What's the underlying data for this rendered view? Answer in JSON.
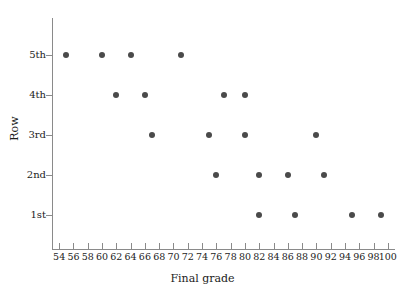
{
  "chart_data": {
    "type": "scatter",
    "title": "",
    "xlabel": "Final grade",
    "ylabel": "Row",
    "xlim": [
      53,
      101
    ],
    "xticks": [
      54,
      56,
      58,
      60,
      62,
      64,
      66,
      68,
      70,
      72,
      74,
      76,
      78,
      80,
      82,
      84,
      86,
      88,
      90,
      92,
      94,
      96,
      98,
      100
    ],
    "xtick_labels": [
      "54",
      "56",
      "58",
      "60",
      "62",
      "64",
      "66",
      "68",
      "70",
      "72",
      "74",
      "76",
      "78",
      "80",
      "82",
      "84",
      "86",
      "88",
      "90",
      "92",
      "94",
      "96",
      "98",
      "100"
    ],
    "ycategories": [
      "1st",
      "2nd",
      "3rd",
      "4th",
      "5th"
    ],
    "ytick_labels": [
      "5th",
      "4th",
      "3rd",
      "2nd",
      "1st"
    ],
    "grid": false,
    "legend": false,
    "marker_color": "#4a4a4a",
    "axis_color": "#8a8a8a",
    "points": [
      {
        "x": 55,
        "y": "5th"
      },
      {
        "x": 60,
        "y": "5th"
      },
      {
        "x": 64,
        "y": "5th"
      },
      {
        "x": 71,
        "y": "5th"
      },
      {
        "x": 62,
        "y": "4th"
      },
      {
        "x": 66,
        "y": "4th"
      },
      {
        "x": 77,
        "y": "4th"
      },
      {
        "x": 80,
        "y": "4th"
      },
      {
        "x": 67,
        "y": "3rd"
      },
      {
        "x": 75,
        "y": "3rd"
      },
      {
        "x": 80,
        "y": "3rd"
      },
      {
        "x": 90,
        "y": "3rd"
      },
      {
        "x": 76,
        "y": "2nd"
      },
      {
        "x": 82,
        "y": "2nd"
      },
      {
        "x": 86,
        "y": "2nd"
      },
      {
        "x": 91,
        "y": "2nd"
      },
      {
        "x": 82,
        "y": "1st"
      },
      {
        "x": 87,
        "y": "1st"
      },
      {
        "x": 95,
        "y": "1st"
      },
      {
        "x": 99,
        "y": "1st"
      }
    ]
  }
}
